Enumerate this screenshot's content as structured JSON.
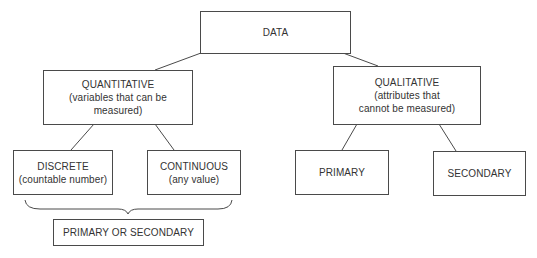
{
  "diagram": {
    "root": {
      "title": "DATA"
    },
    "quantitative": {
      "title": "QUANTITATIVE",
      "subtitle_line1": "(variables that can be",
      "subtitle_line2": "measured)"
    },
    "qualitative": {
      "title": "QUALITATIVE",
      "subtitle_line1": "(attributes that",
      "subtitle_line2": "cannot be measured)"
    },
    "discrete": {
      "title": "DISCRETE",
      "subtitle": "(countable number)"
    },
    "continuous": {
      "title": "CONTINUOUS",
      "subtitle": "(any value)"
    },
    "qual_primary": {
      "title": "PRIMARY"
    },
    "qual_secondary": {
      "title": "SECONDARY"
    },
    "quant_source": {
      "title": "PRIMARY OR SECONDARY"
    },
    "edges": [
      [
        "DATA",
        "QUANTITATIVE"
      ],
      [
        "DATA",
        "QUALITATIVE"
      ],
      [
        "QUANTITATIVE",
        "DISCRETE"
      ],
      [
        "QUANTITATIVE",
        "CONTINUOUS"
      ],
      [
        "QUALITATIVE",
        "PRIMARY"
      ],
      [
        "QUALITATIVE",
        "SECONDARY"
      ],
      [
        "DISCRETE+CONTINUOUS",
        "PRIMARY OR SECONDARY"
      ]
    ],
    "line_color": "#4a4a4a"
  }
}
